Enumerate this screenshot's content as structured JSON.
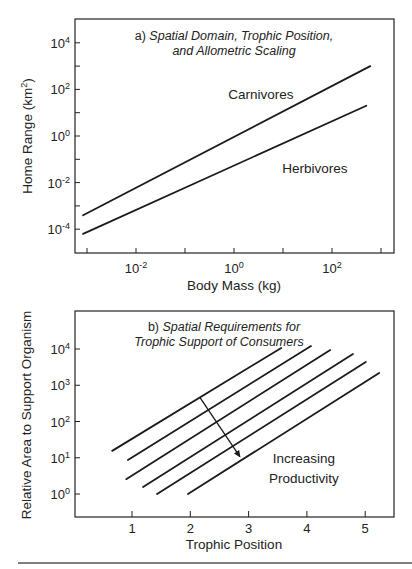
{
  "chart_data": [
    {
      "id": "a",
      "type": "line",
      "title_prefix": "a)",
      "title_line1": "Spatial Domain, Trophic Position,",
      "title_line2": "and Allometric Scaling",
      "xlabel": "Body Mass (kg)",
      "ylabel": "Home Range (km",
      "ylabel_sup": "2",
      "ylabel_close": ")",
      "xscale": "log",
      "yscale": "log",
      "xlim_log10": [
        -3.3,
        3.3
      ],
      "ylim_log10": [
        -4.6,
        5.1
      ],
      "x_ticks_log10": [
        -3,
        -2,
        -1,
        0,
        1,
        2,
        3
      ],
      "x_tick_labels": [
        {
          "log10": -2,
          "base": "10",
          "exp": "-2"
        },
        {
          "log10": 0,
          "base": "10",
          "exp": "0"
        },
        {
          "log10": 2,
          "base": "10",
          "exp": "2"
        }
      ],
      "y_ticks_log10": [
        -4,
        -3,
        -2,
        -1,
        0,
        1,
        2,
        3,
        4
      ],
      "y_tick_labels": [
        {
          "log10": 4,
          "base": "10",
          "exp": "4"
        },
        {
          "log10": 2,
          "base": "10",
          "exp": "2"
        },
        {
          "log10": 0,
          "base": "10",
          "exp": "0"
        },
        {
          "log10": -2,
          "base": "10",
          "exp": "-2"
        },
        {
          "log10": -4,
          "base": "10",
          "exp": "-4"
        }
      ],
      "grid": false,
      "series": [
        {
          "name": "Carnivores",
          "x_log10": [
            -3.08,
            2.78
          ],
          "y_log10": [
            -3.4,
            3.0
          ]
        },
        {
          "name": "Herbivores",
          "x_log10": [
            -3.08,
            2.7
          ],
          "y_log10": [
            -4.2,
            1.3
          ]
        }
      ],
      "annotations": [
        {
          "text": "Carnivores",
          "x_log10": 0.55,
          "y_log10": 1.6
        },
        {
          "text": "Herbivores",
          "x_log10": 1.65,
          "y_log10": -1.6
        }
      ]
    },
    {
      "id": "b",
      "type": "line",
      "title_prefix": "b)",
      "title_line1": "Spatial Requirements for",
      "title_line2": "Trophic  Support of  Consumers",
      "xlabel": "Trophic Position",
      "ylabel": "Relative Area to Support Organism",
      "xscale": "linear",
      "yscale": "log",
      "xlim": [
        0,
        5.55
      ],
      "ylim_log10": [
        -0.65,
        5.05
      ],
      "x_ticks": [
        1,
        2,
        3,
        4,
        5
      ],
      "x_tick_labels": [
        "1",
        "2",
        "3",
        "4",
        "5"
      ],
      "y_ticks_log10": [
        0,
        1,
        2,
        3,
        4
      ],
      "y_tick_labels": [
        {
          "log10": 4,
          "base": "10",
          "exp": "4"
        },
        {
          "log10": 3,
          "base": "10",
          "exp": "3"
        },
        {
          "log10": 2,
          "base": "10",
          "exp": "2"
        },
        {
          "log10": 1,
          "base": "10",
          "exp": "1"
        },
        {
          "log10": 0,
          "base": "10",
          "exp": "0"
        }
      ],
      "grid": false,
      "series": [
        {
          "name": "productivity-level-1",
          "x": [
            0.66,
            3.56
          ],
          "y_log10": [
            1.19,
            4.03
          ]
        },
        {
          "name": "productivity-level-2",
          "x": [
            0.93,
            4.07
          ],
          "y_log10": [
            0.94,
            4.08
          ]
        },
        {
          "name": "productivity-level-3",
          "x": [
            0.9,
            4.4
          ],
          "y_log10": [
            0.41,
            3.97
          ]
        },
        {
          "name": "productivity-level-4",
          "x": [
            1.19,
            4.79
          ],
          "y_log10": [
            0.19,
            3.86
          ]
        },
        {
          "name": "productivity-level-5",
          "x": [
            1.43,
            5.01
          ],
          "y_log10": [
            0.0,
            3.64
          ]
        },
        {
          "name": "productivity-level-6",
          "x": [
            1.96,
            5.24
          ],
          "y_log10": [
            0.0,
            3.34
          ]
        }
      ],
      "arrow": {
        "from_x": 2.17,
        "from_y_log10": 2.65,
        "to_x": 2.85,
        "to_y_log10": 1.03
      },
      "annotations": [
        {
          "text": "Increasing",
          "x": 3.95,
          "y_log10": 0.85
        },
        {
          "text": "Productivity",
          "x": 3.95,
          "y_log10": 0.3
        }
      ]
    }
  ],
  "footer": {
    "rule": true
  }
}
